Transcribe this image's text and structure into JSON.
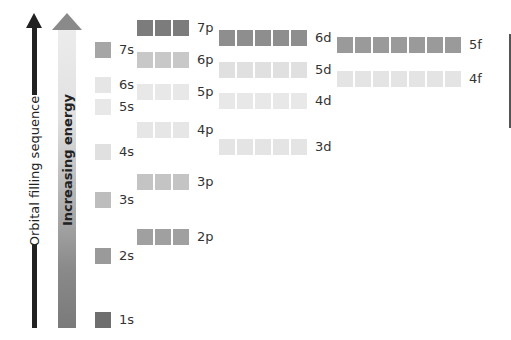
{
  "arrows": {
    "filling_sequence": {
      "label": "Orbital filling sequence",
      "color": "#222222"
    },
    "energy": {
      "label": "Increasing energy",
      "color_top": "#ececec",
      "color_bottom": "#7a7a7a"
    }
  },
  "subshells": [
    {
      "name": "1s",
      "label": "1s",
      "orbitals": 1,
      "x": 95,
      "y": 312,
      "color": "#6e6e6e"
    },
    {
      "name": "2s",
      "label": "2s",
      "orbitals": 1,
      "x": 95,
      "y": 248,
      "color": "#9a9a9a"
    },
    {
      "name": "2p",
      "label": "2p",
      "orbitals": 3,
      "x": 137,
      "y": 229,
      "color": "#a0a0a0"
    },
    {
      "name": "3s",
      "label": "3s",
      "orbitals": 1,
      "x": 95,
      "y": 192,
      "color": "#bdbdbd"
    },
    {
      "name": "3p",
      "label": "3p",
      "orbitals": 3,
      "x": 137,
      "y": 174,
      "color": "#c4c4c4"
    },
    {
      "name": "4s",
      "label": "4s",
      "orbitals": 1,
      "x": 95,
      "y": 144,
      "color": "#e0e0e0"
    },
    {
      "name": "3d",
      "label": "3d",
      "orbitals": 5,
      "x": 219,
      "y": 139,
      "color": "#e4e4e4"
    },
    {
      "name": "4p",
      "label": "4p",
      "orbitals": 3,
      "x": 137,
      "y": 122,
      "color": "#e6e6e6"
    },
    {
      "name": "5s",
      "label": "5s",
      "orbitals": 1,
      "x": 95,
      "y": 99,
      "color": "#e8e8e8"
    },
    {
      "name": "4d",
      "label": "4d",
      "orbitals": 5,
      "x": 219,
      "y": 93,
      "color": "#e8e8e8"
    },
    {
      "name": "5p",
      "label": "5p",
      "orbitals": 3,
      "x": 137,
      "y": 84,
      "color": "#e8e8e8"
    },
    {
      "name": "6s",
      "label": "6s",
      "orbitals": 1,
      "x": 95,
      "y": 77,
      "color": "#e6e6e6"
    },
    {
      "name": "4f",
      "label": "4f",
      "orbitals": 7,
      "x": 337,
      "y": 71,
      "color": "#e4e4e4"
    },
    {
      "name": "5d",
      "label": "5d",
      "orbitals": 5,
      "x": 219,
      "y": 62,
      "color": "#e0e0e0"
    },
    {
      "name": "6p",
      "label": "6p",
      "orbitals": 3,
      "x": 137,
      "y": 52,
      "color": "#c8c8c8"
    },
    {
      "name": "7s",
      "label": "7s",
      "orbitals": 1,
      "x": 95,
      "y": 42,
      "color": "#a6a6a6"
    },
    {
      "name": "5f",
      "label": "5f",
      "orbitals": 7,
      "x": 337,
      "y": 37,
      "color": "#9a9a9a"
    },
    {
      "name": "6d",
      "label": "6d",
      "orbitals": 5,
      "x": 219,
      "y": 30,
      "color": "#8e8e8e"
    },
    {
      "name": "7p",
      "label": "7p",
      "orbitals": 3,
      "x": 137,
      "y": 20,
      "color": "#7c7c7c"
    }
  ]
}
